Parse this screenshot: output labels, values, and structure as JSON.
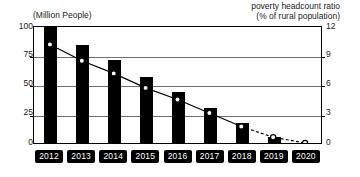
{
  "chart_data": {
    "type": "bar",
    "title": "",
    "subtitle": "",
    "xlabel": "",
    "ylabel": "(Million People)",
    "y2label": "poverty headcount ratio (% of rural population)",
    "categories": [
      "2012",
      "2013",
      "2014",
      "2015",
      "2016",
      "2017",
      "2018",
      "2019",
      "2020"
    ],
    "grid": true,
    "legend": "none",
    "ylim": [
      0,
      100
    ],
    "yticks": [
      "0",
      "25",
      "50",
      "75",
      "100"
    ],
    "ytick_values": [
      0,
      25,
      50,
      75,
      100
    ],
    "y2lim": [
      0,
      12
    ],
    "y2ticks": [
      "0",
      "3",
      "6",
      "9",
      "12"
    ],
    "y2tick_values": [
      0,
      3,
      6,
      9,
      12
    ],
    "series": [
      {
        "name": "Rural poor population",
        "type": "bar",
        "axis": "left",
        "unit": "Million People",
        "color": "#000000",
        "values": [
          98,
          83,
          70,
          56,
          43,
          30,
          17,
          5,
          null
        ]
      },
      {
        "name": "poverty headcount ratio",
        "type": "line",
        "axis": "right",
        "unit": "% of rural population",
        "color": "#000000",
        "marker": "white-filled-circle",
        "solid_through": "2018",
        "dashed_from": "2018",
        "values": [
          10.2,
          8.5,
          7.2,
          5.7,
          4.5,
          3.1,
          1.7,
          0.6,
          0.0
        ]
      }
    ]
  },
  "axes": {
    "left_title": "(Million People)",
    "right_title_line1": "poverty headcount ratio",
    "right_title_line2": "(% of rural population)"
  }
}
